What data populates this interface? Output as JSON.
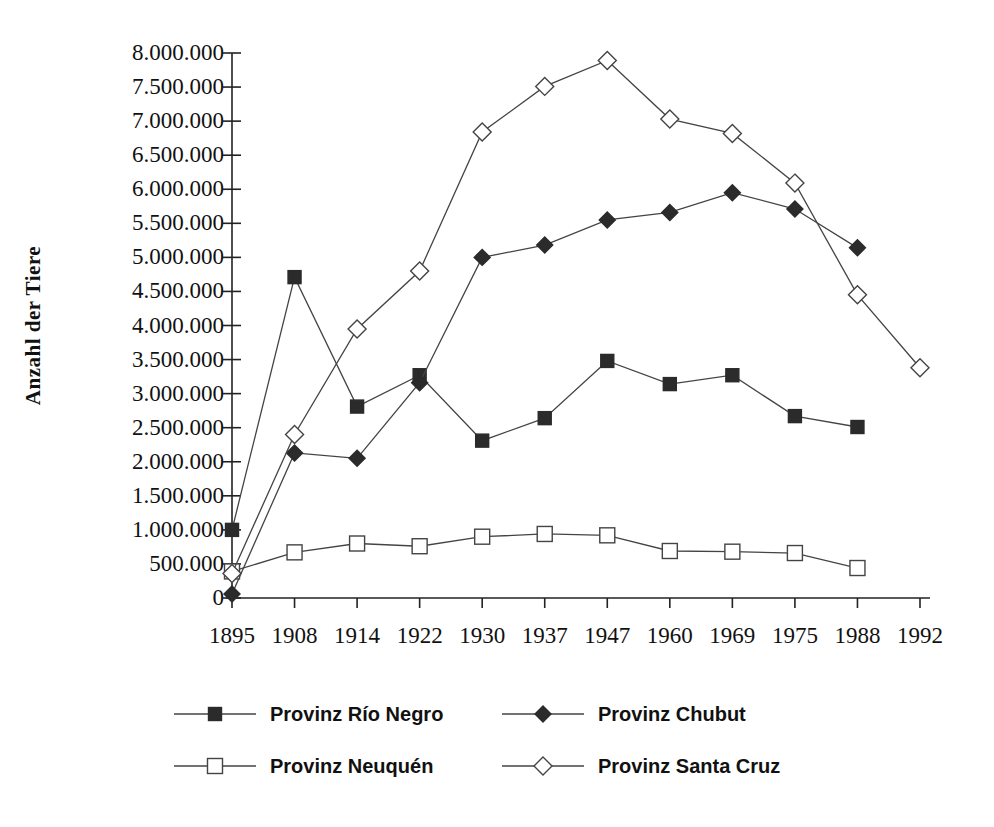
{
  "chart_data": {
    "type": "line",
    "title": "",
    "xlabel": "",
    "ylabel": "Anzahl der Tiere",
    "categories": [
      "1895",
      "1908",
      "1914",
      "1922",
      "1930",
      "1937",
      "1947",
      "1960",
      "1969",
      "1975",
      "1988",
      "1992"
    ],
    "ylim": [
      0,
      8000000
    ],
    "ytick_step": 500000,
    "ytick_labels": [
      "8.000.000",
      "7.500.000",
      "7.000.000",
      "6.500.000",
      "6.000.000",
      "5.500.000",
      "5.000.000",
      "4.500.000",
      "4.000.000",
      "3.500.000",
      "3.000.000",
      "2.500.000",
      "2.000.000",
      "1.500.000",
      "1.000.000",
      "500.000",
      "0"
    ],
    "grid": false,
    "legend_position": "bottom",
    "series": [
      {
        "name": "Provinz Río Negro",
        "marker": "filled-square",
        "color": "#333333",
        "values": [
          1000000,
          4710000,
          2810000,
          3270000,
          2310000,
          2640000,
          3480000,
          3140000,
          3270000,
          2670000,
          2510000,
          null
        ]
      },
      {
        "name": "Provinz Chubut",
        "marker": "filled-diamond",
        "color": "#333333",
        "values": [
          60000,
          2130000,
          2050000,
          3160000,
          5000000,
          5180000,
          5550000,
          5660000,
          5950000,
          5710000,
          5140000,
          null
        ]
      },
      {
        "name": "Provinz Neuquén",
        "marker": "open-square",
        "color": "#555555",
        "values": [
          390000,
          670000,
          800000,
          760000,
          900000,
          940000,
          920000,
          690000,
          680000,
          660000,
          440000,
          null
        ]
      },
      {
        "name": "Provinz Santa Cruz",
        "marker": "open-diamond",
        "color": "#555555",
        "values": [
          360000,
          2400000,
          3950000,
          4800000,
          6840000,
          7510000,
          7890000,
          7030000,
          6820000,
          6090000,
          4450000,
          3380000
        ]
      }
    ]
  },
  "legend": {
    "items": [
      {
        "label": "Provinz Río Negro",
        "marker": "filled-square"
      },
      {
        "label": "Provinz Chubut",
        "marker": "filled-diamond"
      },
      {
        "label": "Provinz Neuquén",
        "marker": "open-square"
      },
      {
        "label": "Provinz Santa Cruz",
        "marker": "open-diamond"
      }
    ]
  },
  "colors": {
    "axis": "#222222",
    "line": "#444444",
    "marker_fill_solid": "#2b2b2b",
    "marker_fill_open": "#ffffff",
    "text": "#111111"
  }
}
